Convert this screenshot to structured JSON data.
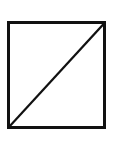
{
  "canvas": {
    "width": 113,
    "height": 145,
    "background_color": "#ffffff",
    "description": "Line drawing of a square divided by one diagonal"
  },
  "figure": {
    "name": "square-with-diagonal",
    "title": "Square with diagonal",
    "stroke_color": "#111111",
    "fill_color": "#ffffff",
    "square": {
      "label": "square-outline",
      "x": 8.5,
      "y": 22.5,
      "width": 96,
      "height": 105,
      "stroke_width": 3
    },
    "diagonal": {
      "label": "diagonal-line",
      "direction": "bottom-left-to-top-right",
      "x1": 9.5,
      "y1": 126.5,
      "x2": 103.5,
      "y2": 24.0,
      "stroke_width": 2.3
    },
    "regions": [
      {
        "name": "upper-left-triangle"
      },
      {
        "name": "lower-right-triangle"
      }
    ]
  }
}
